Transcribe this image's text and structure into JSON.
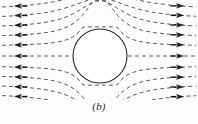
{
  "figure": {
    "caption": "(b)",
    "title": "",
    "background_color": "#fdfdfd",
    "line_color": "#4a4a4a",
    "arrow_color": "#1a1a1a",
    "circle_stroke_color": "#2b2b2b",
    "circle_fill_color": "#ffffff"
  },
  "chart_data": {
    "type": "line",
    "title": "",
    "subtitle": "",
    "xlabel": "",
    "ylabel": "",
    "xlim": [
      0,
      198
    ],
    "ylim": [
      0,
      100
    ],
    "grid": false,
    "legend_position": "none",
    "annotations": [
      "(b)"
    ],
    "obstacle": {
      "shape": "circle",
      "cx": 100,
      "cy": 56,
      "r": 27,
      "fill": "#ffffff",
      "stroke": "#2b2b2b",
      "stroke_width": 1.1
    },
    "flow": {
      "description": "dashed streamlines of uniform horizontal flow deflected around a circular cylinder",
      "dash_pattern": "4 3",
      "arrowheads": {
        "left_side_direction": "left",
        "right_side_direction": "right",
        "left_x": 18,
        "right_x": 180
      },
      "streamline_y_at_infinity": [
        10,
        19,
        28,
        37,
        46,
        56,
        66,
        75,
        84,
        93,
        99
      ],
      "n_streamlines": 11
    },
    "series": [
      {
        "name": "streamline-1",
        "y0": 10,
        "values": [
          10,
          10,
          10.2,
          10.6,
          11.4,
          12.6,
          11.4,
          10.6,
          10.2,
          10,
          10
        ]
      },
      {
        "name": "streamline-2",
        "y0": 19,
        "values": [
          19,
          19,
          19.3,
          20.0,
          21.3,
          23.2,
          21.3,
          20.0,
          19.3,
          19,
          19
        ]
      },
      {
        "name": "streamline-3",
        "y0": 28,
        "values": [
          28,
          28,
          28.4,
          29.4,
          31.2,
          33.8,
          31.2,
          29.4,
          28.4,
          28,
          28
        ]
      },
      {
        "name": "streamline-4",
        "y0": 37,
        "values": [
          37,
          37,
          37.4,
          38.4,
          40.2,
          42.8,
          40.2,
          38.4,
          37.4,
          37,
          37
        ]
      },
      {
        "name": "streamline-5",
        "y0": 46,
        "values": [
          46,
          46,
          46.2,
          46.8,
          47.8,
          49.2,
          47.8,
          46.8,
          46.2,
          46,
          46
        ]
      },
      {
        "name": "streamline-6",
        "y0": 56,
        "values": [
          56,
          56,
          56,
          56,
          56,
          56,
          56,
          56,
          56,
          56,
          56
        ]
      },
      {
        "name": "streamline-7",
        "y0": 66,
        "values": [
          66,
          66,
          65.8,
          65.2,
          64.2,
          62.8,
          64.2,
          65.2,
          65.8,
          66,
          66
        ]
      },
      {
        "name": "streamline-8",
        "y0": 75,
        "values": [
          75,
          75,
          74.6,
          73.6,
          71.8,
          69.2,
          71.8,
          73.6,
          74.6,
          75,
          75
        ]
      },
      {
        "name": "streamline-9",
        "y0": 84,
        "values": [
          84,
          84,
          83.6,
          82.6,
          80.8,
          78.2,
          80.8,
          82.6,
          83.6,
          84,
          84
        ]
      },
      {
        "name": "streamline-10",
        "y0": 93,
        "values": [
          93,
          93,
          92.7,
          92.0,
          90.7,
          88.8,
          90.7,
          92.0,
          92.7,
          93,
          93
        ]
      },
      {
        "name": "streamline-11",
        "y0": 99,
        "values": [
          99,
          99,
          98.8,
          98.4,
          97.6,
          96.4,
          97.6,
          98.4,
          98.8,
          99,
          99
        ]
      }
    ]
  }
}
